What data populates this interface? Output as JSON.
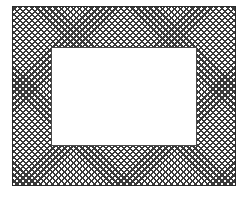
{
  "figure": {
    "shape": "rectangular-frame",
    "pattern": "cross-hatch",
    "colors": {
      "background": "#ffffff",
      "hatch": "#3a3a3a",
      "opening": "#ffffff"
    }
  }
}
